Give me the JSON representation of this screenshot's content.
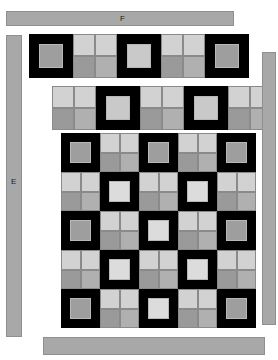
{
  "figure": {
    "title_label": "",
    "background": "#ffffff"
  },
  "bars": [
    {
      "id": "bar-top",
      "label": "F",
      "orientation": "horizontal",
      "color": "#a8a8a8",
      "border": "#8f8f8f"
    },
    {
      "id": "bar-left",
      "label": "E",
      "orientation": "vertical",
      "color": "#a8a8a8",
      "border": "#8f8f8f"
    },
    {
      "id": "bar-right",
      "label": "",
      "orientation": "vertical",
      "color": "#a8a8a8",
      "border": "#8f8f8f"
    },
    {
      "id": "bar-bottom",
      "label": "",
      "orientation": "horizontal",
      "color": "#a8a8a8",
      "border": "#8f8f8f"
    }
  ],
  "palette": {
    "black": "#000000",
    "light": "#d2d2d2",
    "light2": "#cfcfcf",
    "mid": "#9a9a9a",
    "mid2": "#b0b0b0",
    "inner_light": "#c9c9c9",
    "inner_mid": "#9e9e9e",
    "inner_bright": "#dcdcdc",
    "seam": "#8a8a8a",
    "bar": "#a8a8a8",
    "bar_border": "#8f8f8f"
  },
  "tile_types": {
    "frame": "framed-square-tile",
    "quad": "four-quadrant-tile"
  },
  "rows": [
    {
      "name": "row-top-strip",
      "x": 29,
      "y": 34,
      "cell": 44,
      "count": 5,
      "tiles": [
        {
          "type": "frame",
          "inner": "#9e9e9e"
        },
        {
          "type": "quad",
          "quads": [
            "#d2d2d2",
            "#d2d2d2",
            "#9a9a9a",
            "#b0b0b0"
          ]
        },
        {
          "type": "frame",
          "inner": "#c9c9c9"
        },
        {
          "type": "quad",
          "quads": [
            "#d2d2d2",
            "#d2d2d2",
            "#9a9a9a",
            "#b0b0b0"
          ]
        },
        {
          "type": "frame",
          "inner": "#9e9e9e"
        }
      ]
    },
    {
      "name": "row-second-strip",
      "x": 52,
      "y": 86,
      "cell": 44,
      "count": 5,
      "tiles": [
        {
          "type": "quad",
          "quads": [
            "#d2d2d2",
            "#d2d2d2",
            "#9a9a9a",
            "#b0b0b0"
          ]
        },
        {
          "type": "frame",
          "inner": "#c9c9c9"
        },
        {
          "type": "quad",
          "quads": [
            "#d2d2d2",
            "#d2d2d2",
            "#9a9a9a",
            "#b0b0b0"
          ]
        },
        {
          "type": "frame",
          "inner": "#c9c9c9"
        },
        {
          "type": "quad",
          "quads": [
            "#d2d2d2",
            "#d2d2d2",
            "#9a9a9a",
            "#b0b0b0"
          ]
        }
      ]
    }
  ],
  "main_grid": {
    "name": "main-tiling-grid",
    "x": 61,
    "y": 133,
    "cell": 39,
    "cols": 5,
    "rows": 5,
    "cells": [
      [
        {
          "type": "frame",
          "inner": "#9e9e9e"
        },
        {
          "type": "quad",
          "quads": [
            "#d2d2d2",
            "#d2d2d2",
            "#9a9a9a",
            "#b0b0b0"
          ]
        },
        {
          "type": "frame",
          "inner": "#9e9e9e"
        },
        {
          "type": "quad",
          "quads": [
            "#d2d2d2",
            "#d2d2d2",
            "#9a9a9a",
            "#b0b0b0"
          ]
        },
        {
          "type": "frame",
          "inner": "#9e9e9e"
        }
      ],
      [
        {
          "type": "quad",
          "quads": [
            "#d2d2d2",
            "#d2d2d2",
            "#9a9a9a",
            "#b0b0b0"
          ]
        },
        {
          "type": "frame",
          "inner": "#dcdcdc"
        },
        {
          "type": "quad",
          "quads": [
            "#d2d2d2",
            "#d2d2d2",
            "#9a9a9a",
            "#b0b0b0"
          ]
        },
        {
          "type": "frame",
          "inner": "#dcdcdc"
        },
        {
          "type": "quad",
          "quads": [
            "#d2d2d2",
            "#d2d2d2",
            "#9a9a9a",
            "#b0b0b0"
          ]
        }
      ],
      [
        {
          "type": "frame",
          "inner": "#9e9e9e"
        },
        {
          "type": "quad",
          "quads": [
            "#d2d2d2",
            "#d2d2d2",
            "#9a9a9a",
            "#b0b0b0"
          ]
        },
        {
          "type": "frame",
          "inner": "#dcdcdc"
        },
        {
          "type": "quad",
          "quads": [
            "#d2d2d2",
            "#d2d2d2",
            "#9a9a9a",
            "#b0b0b0"
          ]
        },
        {
          "type": "frame",
          "inner": "#9e9e9e"
        }
      ],
      [
        {
          "type": "quad",
          "quads": [
            "#d2d2d2",
            "#d2d2d2",
            "#9a9a9a",
            "#b0b0b0"
          ]
        },
        {
          "type": "frame",
          "inner": "#dcdcdc"
        },
        {
          "type": "quad",
          "quads": [
            "#d2d2d2",
            "#d2d2d2",
            "#9a9a9a",
            "#b0b0b0"
          ]
        },
        {
          "type": "frame",
          "inner": "#dcdcdc"
        },
        {
          "type": "quad",
          "quads": [
            "#d2d2d2",
            "#d2d2d2",
            "#9a9a9a",
            "#b0b0b0"
          ]
        }
      ],
      [
        {
          "type": "frame",
          "inner": "#9e9e9e"
        },
        {
          "type": "quad",
          "quads": [
            "#d2d2d2",
            "#d2d2d2",
            "#9a9a9a",
            "#b0b0b0"
          ]
        },
        {
          "type": "frame",
          "inner": "#dcdcdc"
        },
        {
          "type": "quad",
          "quads": [
            "#d2d2d2",
            "#d2d2d2",
            "#9a9a9a",
            "#b0b0b0"
          ]
        },
        {
          "type": "frame",
          "inner": "#9e9e9e"
        }
      ]
    ]
  }
}
